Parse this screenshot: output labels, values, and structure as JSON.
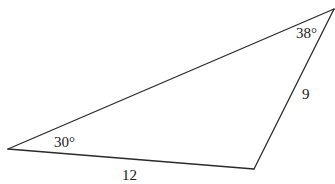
{
  "diagram": {
    "type": "triangle",
    "vertices": {
      "left": {
        "x": 8,
        "y": 149
      },
      "top_right": {
        "x": 334,
        "y": 9
      },
      "bottom_right": {
        "x": 254,
        "y": 169
      }
    },
    "angles": {
      "left": {
        "label": "30°",
        "x": 54,
        "y": 147
      },
      "top_right": {
        "label": "38°",
        "x": 296,
        "y": 38
      }
    },
    "sides": {
      "bottom": {
        "label": "12",
        "x": 122,
        "y": 180
      },
      "right": {
        "label": "9",
        "x": 302,
        "y": 99
      }
    },
    "stroke_color": "#2a2a2a",
    "background_color": "#ffffff"
  }
}
